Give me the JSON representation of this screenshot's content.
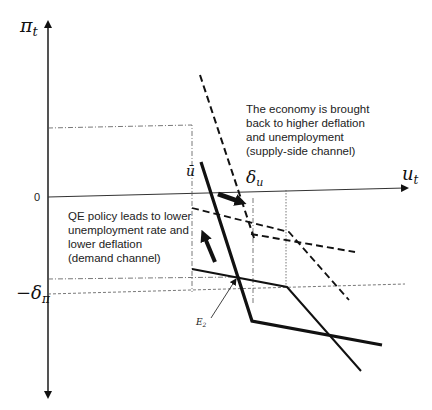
{
  "diagram": {
    "axes": {
      "y_label": "π",
      "y_label_sub": "t",
      "x_label": "u",
      "x_label_sub": "t",
      "origin_label": "0",
      "neg_delta_pi_minus": "−δ",
      "neg_delta_pi_sub": "π"
    },
    "markers": {
      "u_bar": "ū",
      "delta_u": "δ",
      "delta_u_sub": "u",
      "equilibrium": "E",
      "equilibrium_sub": "2"
    },
    "annotations": {
      "supply_side": [
        "The economy is brought",
        "back to higher deflation",
        "and unemployment",
        "(supply-side channel)"
      ],
      "demand": [
        "QE policy leads to lower",
        "unemployment rate and",
        "lower deflation",
        "(demand channel)"
      ]
    },
    "colors": {
      "line": "#111111",
      "guide": "#555555",
      "background": "#ffffff"
    }
  }
}
